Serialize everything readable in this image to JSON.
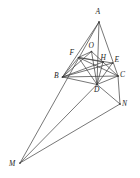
{
  "figure": {
    "type": "geometry-diagram",
    "background_color": "#ffffff",
    "line_color": "#3c3c3c",
    "label_color": "#1c1c1c",
    "canvas": {
      "width": 140,
      "height": 178
    },
    "points": [
      {
        "id": "A",
        "label": "A",
        "x": 99.0,
        "y": 22.0,
        "label_x": 95.5,
        "label_y": 7.5
      },
      {
        "id": "B",
        "label": "B",
        "x": 62.5,
        "y": 77.0,
        "label_x": 54.0,
        "label_y": 71.5
      },
      {
        "id": "C",
        "label": "C",
        "x": 118.0,
        "y": 76.0,
        "label_x": 120.0,
        "label_y": 70.5
      },
      {
        "id": "D",
        "label": "D",
        "x": 97.0,
        "y": 84.5,
        "label_x": 94.0,
        "label_y": 85.5
      },
      {
        "id": "E",
        "label": "E",
        "x": 112.5,
        "y": 63.0,
        "label_x": 114.5,
        "label_y": 55.5
      },
      {
        "id": "F",
        "label": "F",
        "x": 78.5,
        "y": 57.5,
        "label_x": 69.5,
        "label_y": 49.0
      },
      {
        "id": "H",
        "label": "H",
        "x": 103.0,
        "y": 62.0,
        "label_x": 100.5,
        "label_y": 53.5
      },
      {
        "id": "O",
        "label": "O",
        "x": 91.5,
        "y": 51.5,
        "label_x": 88.5,
        "label_y": 41.5
      },
      {
        "id": "M",
        "label": "M",
        "x": 20.0,
        "y": 163.0,
        "label_x": 9.0,
        "label_y": 159.5
      },
      {
        "id": "N",
        "label": "N",
        "x": 120.0,
        "y": 104.0,
        "label_x": 122.0,
        "label_y": 99.5
      }
    ],
    "segments": [
      {
        "from": "A",
        "to": "B"
      },
      {
        "from": "A",
        "to": "C"
      },
      {
        "from": "B",
        "to": "C"
      },
      {
        "from": "A",
        "to": "D"
      },
      {
        "from": "B",
        "to": "E"
      },
      {
        "from": "C",
        "to": "F"
      },
      {
        "from": "B",
        "to": "F"
      },
      {
        "from": "B",
        "to": "O"
      },
      {
        "from": "B",
        "to": "H"
      },
      {
        "from": "B",
        "to": "D"
      },
      {
        "from": "F",
        "to": "O"
      },
      {
        "from": "F",
        "to": "H"
      },
      {
        "from": "F",
        "to": "E"
      },
      {
        "from": "F",
        "to": "D"
      },
      {
        "from": "O",
        "to": "H"
      },
      {
        "from": "O",
        "to": "D"
      },
      {
        "from": "H",
        "to": "D"
      },
      {
        "from": "H",
        "to": "C"
      },
      {
        "from": "E",
        "to": "D"
      },
      {
        "from": "D",
        "to": "C"
      },
      {
        "from": "D",
        "to": "N"
      },
      {
        "from": "C",
        "to": "N"
      },
      {
        "from": "M",
        "to": "N"
      },
      {
        "from": "M",
        "to": "A"
      },
      {
        "from": "M",
        "to": "D"
      }
    ],
    "labels_style": {
      "font_style": "italic",
      "font_size_px": 7.5
    }
  }
}
